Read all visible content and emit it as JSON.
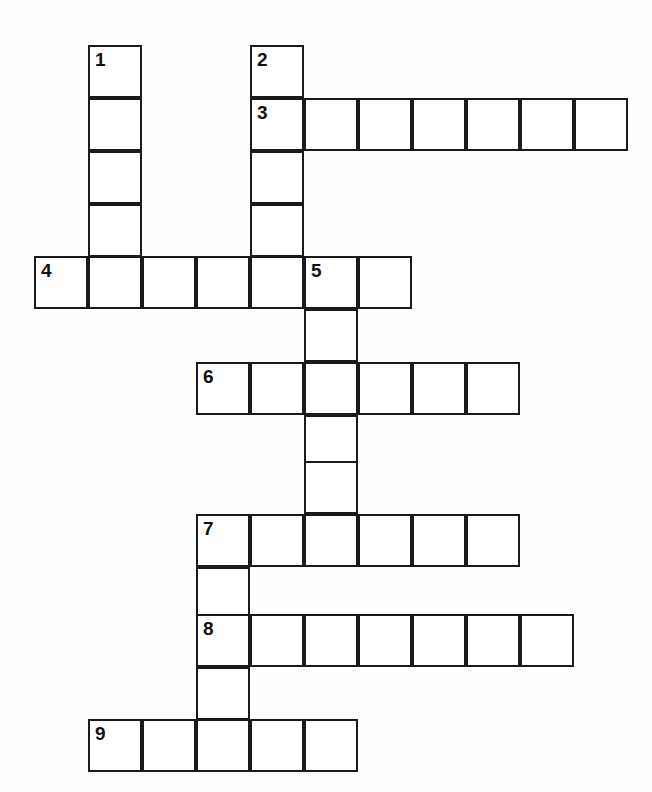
{
  "puzzle": {
    "type": "crossword-grid",
    "title": "Crossword Puzzle Grid",
    "background_color": "#fefefe",
    "cell_fill_color": "#ffffff",
    "cell_border_color": "#1a1a1a",
    "number_color": "#111111",
    "cell_size_px": 54,
    "grid_columns": 12,
    "grid_rows": 14,
    "total_cells": 51,
    "clue_numbers": [
      "1",
      "2",
      "3",
      "4",
      "5",
      "6",
      "7",
      "8",
      "9"
    ],
    "entries": [
      {
        "number": "1",
        "direction": "down",
        "length": 4,
        "start_col": 1,
        "start_row": 0
      },
      {
        "number": "2",
        "direction": "down",
        "length": 5,
        "start_col": 4,
        "start_row": 0
      },
      {
        "number": "3",
        "direction": "across",
        "length": 7,
        "start_col": 4,
        "start_row": 1
      },
      {
        "number": "4",
        "direction": "across",
        "length": 7,
        "start_col": 0,
        "start_row": 4
      },
      {
        "number": "5",
        "direction": "down",
        "length": 5,
        "start_col": 6,
        "start_row": 4
      },
      {
        "number": "6",
        "direction": "across",
        "length": 6,
        "start_col": 3,
        "start_row": 6
      },
      {
        "number": "7",
        "direction": "across",
        "length": 6,
        "start_col": 3,
        "start_row": 9
      },
      {
        "number": "8",
        "direction": "across",
        "length": 7,
        "start_col": 3,
        "start_row": 11
      },
      {
        "number": "9",
        "direction": "across",
        "length": 5,
        "start_col": 1,
        "start_row": 13
      }
    ],
    "cells": [
      {
        "x": 88,
        "y": 45,
        "number": "1"
      },
      {
        "x": 88,
        "y": 98,
        "number": ""
      },
      {
        "x": 88,
        "y": 151,
        "number": ""
      },
      {
        "x": 88,
        "y": 204,
        "number": ""
      },
      {
        "x": 250,
        "y": 45,
        "number": "2"
      },
      {
        "x": 250,
        "y": 98,
        "number": "3"
      },
      {
        "x": 250,
        "y": 151,
        "number": ""
      },
      {
        "x": 250,
        "y": 204,
        "number": ""
      },
      {
        "x": 304,
        "y": 98,
        "number": ""
      },
      {
        "x": 358,
        "y": 98,
        "number": ""
      },
      {
        "x": 412,
        "y": 98,
        "number": ""
      },
      {
        "x": 466,
        "y": 98,
        "number": ""
      },
      {
        "x": 520,
        "y": 98,
        "number": ""
      },
      {
        "x": 574,
        "y": 98,
        "number": ""
      },
      {
        "x": 34,
        "y": 256,
        "number": "4"
      },
      {
        "x": 88,
        "y": 256,
        "number": ""
      },
      {
        "x": 142,
        "y": 256,
        "number": ""
      },
      {
        "x": 196,
        "y": 256,
        "number": ""
      },
      {
        "x": 250,
        "y": 256,
        "number": ""
      },
      {
        "x": 304,
        "y": 256,
        "number": "5"
      },
      {
        "x": 358,
        "y": 256,
        "number": ""
      },
      {
        "x": 304,
        "y": 309,
        "number": ""
      },
      {
        "x": 196,
        "y": 362,
        "number": "6"
      },
      {
        "x": 250,
        "y": 362,
        "number": ""
      },
      {
        "x": 304,
        "y": 362,
        "number": ""
      },
      {
        "x": 358,
        "y": 362,
        "number": ""
      },
      {
        "x": 412,
        "y": 362,
        "number": ""
      },
      {
        "x": 466,
        "y": 362,
        "number": ""
      },
      {
        "x": 304,
        "y": 415,
        "number": ""
      },
      {
        "x": 304,
        "y": 461,
        "number": ""
      },
      {
        "x": 196,
        "y": 514,
        "number": "7"
      },
      {
        "x": 250,
        "y": 514,
        "number": ""
      },
      {
        "x": 304,
        "y": 514,
        "number": ""
      },
      {
        "x": 358,
        "y": 514,
        "number": ""
      },
      {
        "x": 412,
        "y": 514,
        "number": ""
      },
      {
        "x": 466,
        "y": 514,
        "number": ""
      },
      {
        "x": 196,
        "y": 567,
        "number": ""
      },
      {
        "x": 196,
        "y": 614,
        "number": "8"
      },
      {
        "x": 250,
        "y": 614,
        "number": ""
      },
      {
        "x": 304,
        "y": 614,
        "number": ""
      },
      {
        "x": 358,
        "y": 614,
        "number": ""
      },
      {
        "x": 412,
        "y": 614,
        "number": ""
      },
      {
        "x": 466,
        "y": 614,
        "number": ""
      },
      {
        "x": 520,
        "y": 614,
        "number": ""
      },
      {
        "x": 196,
        "y": 667,
        "number": ""
      },
      {
        "x": 88,
        "y": 719,
        "number": "9"
      },
      {
        "x": 142,
        "y": 719,
        "number": ""
      },
      {
        "x": 196,
        "y": 719,
        "number": ""
      },
      {
        "x": 250,
        "y": 719,
        "number": ""
      },
      {
        "x": 304,
        "y": 719,
        "number": ""
      }
    ]
  }
}
